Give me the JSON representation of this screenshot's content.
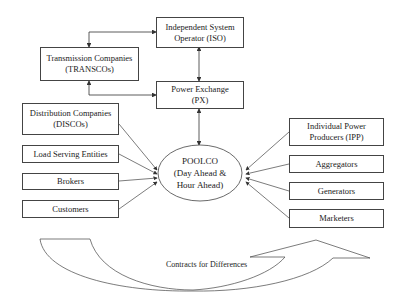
{
  "diagram": {
    "top_nodes": {
      "iso": {
        "line1": "Independent System",
        "line2": "Operator (ISO)"
      },
      "transcos": {
        "line1": "Transmission Companies",
        "line2": "(TRANSCOs)"
      },
      "px": {
        "line1": "Power Exchange",
        "line2": "(PX)"
      }
    },
    "center_node": {
      "line1": "POOLCO",
      "line2": "(Day Ahead &",
      "line3": "Hour Ahead)"
    },
    "left_nodes": [
      {
        "line1": "Distribution Companies",
        "line2": "(DISCOs)"
      },
      {
        "line1": "Load Serving Entities"
      },
      {
        "line1": "Brokers"
      },
      {
        "line1": "Customers"
      }
    ],
    "right_nodes": [
      {
        "line1": "Individual Power",
        "line2": "Producers (IPP)"
      },
      {
        "line1": "Aggregators"
      },
      {
        "line1": "Generators"
      },
      {
        "line1": "Marketers"
      }
    ],
    "bottom_arrow": {
      "label": "Contracts for Differences"
    },
    "colors": {
      "stroke": "#444444",
      "background": "#ffffff"
    }
  }
}
